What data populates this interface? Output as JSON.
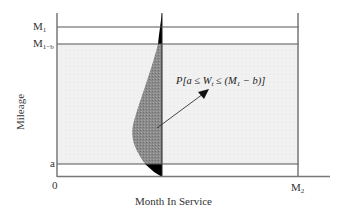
{
  "diagram": {
    "y_axis_label": "Mileage",
    "x_axis_label": "Month In Service",
    "y_ticks": [
      {
        "label": "M",
        "sub": "1",
        "y": 27
      },
      {
        "label": "M",
        "sub": "1−b",
        "y": 44
      },
      {
        "label": "a",
        "sub": "",
        "y": 164
      },
      {
        "label": "0",
        "sub": "",
        "y": 181
      }
    ],
    "x_ticks": [
      {
        "label": "M",
        "sub": "2",
        "x": 298
      }
    ],
    "annotation": {
      "prefix": "P[a ≤ W",
      "sub": "t",
      "suffix": " ≤ (M",
      "sub2": "1",
      "tail": " − b)]"
    },
    "colors": {
      "band": "#eeeeee",
      "distribution_middle": "#8a8a8a",
      "distribution_tails": "#000000",
      "lines": "#666666"
    }
  }
}
